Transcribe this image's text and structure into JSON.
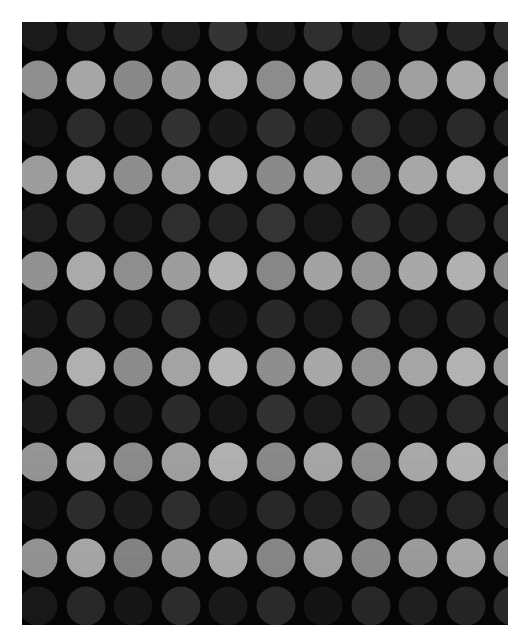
{
  "canvas": {
    "width": 527,
    "height": 643,
    "margin_color": "#ffffff"
  },
  "pattern": {
    "name": "polka-dot-grid",
    "panel": {
      "left": 22,
      "top": 22,
      "width": 486,
      "height": 603,
      "background_color": "#050505"
    },
    "grid": {
      "column_pitch": 47.5,
      "row_pitch": 47.8,
      "first_center_x": 16,
      "first_center_y": 10,
      "dot_diameter": 39,
      "columns": 11,
      "rows": 14,
      "row_offset_mode": "aligned"
    },
    "palette": {
      "light_row_base": "#9a9a9a",
      "dark_row_base": "#1e1e1e",
      "background": "#050505"
    },
    "rows": [
      {
        "index": 0,
        "type": "dark",
        "colors": [
          "#1a1a1a",
          "#232323",
          "#2c2c2c",
          "#1c1c1c",
          "#333333",
          "#1d1d1d",
          "#2e2e2e",
          "#1b1b1b",
          "#303030",
          "#242424",
          "#2a2a2a"
        ]
      },
      {
        "index": 1,
        "type": "light",
        "colors": [
          "#8f8f8f",
          "#a6a6a6",
          "#888888",
          "#9b9b9b",
          "#b0b0b0",
          "#8c8c8c",
          "#a9a9a9",
          "#8b8b8b",
          "#9f9f9f",
          "#ababab",
          "#929292"
        ]
      },
      {
        "index": 2,
        "type": "dark",
        "colors": [
          "#141414",
          "#2b2b2b",
          "#1b1b1b",
          "#313131",
          "#171717",
          "#2f2f2f",
          "#151515",
          "#2d2d2d",
          "#1a1a1a",
          "#292929",
          "#212121"
        ]
      },
      {
        "index": 3,
        "type": "light",
        "colors": [
          "#9c9c9c",
          "#aeaeae",
          "#8d8d8d",
          "#a1a1a1",
          "#b2b2b2",
          "#8a8a8a",
          "#a4a4a4",
          "#909090",
          "#a7a7a7",
          "#b4b4b4",
          "#969696"
        ]
      },
      {
        "index": 4,
        "type": "dark",
        "colors": [
          "#1e1e1e",
          "#2a2a2a",
          "#181818",
          "#2e2e2e",
          "#212121",
          "#343434",
          "#161616",
          "#2b2b2b",
          "#1f1f1f",
          "#252525",
          "#2d2d2d"
        ]
      },
      {
        "index": 5,
        "type": "light",
        "colors": [
          "#919191",
          "#aaaaaa",
          "#8e8e8e",
          "#9d9d9d",
          "#b3b3b3",
          "#878787",
          "#a2a2a2",
          "#949494",
          "#a8a8a8",
          "#b1b1b1",
          "#8f8f8f"
        ]
      },
      {
        "index": 6,
        "type": "dark",
        "colors": [
          "#171717",
          "#2c2c2c",
          "#1d1d1d",
          "#303030",
          "#131313",
          "#282828",
          "#1a1a1a",
          "#323232",
          "#1e1e1e",
          "#262626",
          "#222222"
        ]
      },
      {
        "index": 7,
        "type": "light",
        "colors": [
          "#999999",
          "#b0b0b0",
          "#8b8b8b",
          "#a3a3a3",
          "#b5b5b5",
          "#8d8d8d",
          "#a7a7a7",
          "#929292",
          "#a5a5a5",
          "#b2b2b2",
          "#989898"
        ]
      },
      {
        "index": 8,
        "type": "dark",
        "colors": [
          "#1b1b1b",
          "#2e2e2e",
          "#191919",
          "#2a2a2a",
          "#151515",
          "#313131",
          "#181818",
          "#2c2c2c",
          "#202020",
          "#272727",
          "#2b2b2b"
        ]
      },
      {
        "index": 9,
        "type": "light",
        "colors": [
          "#959595",
          "#acacac",
          "#8c8c8c",
          "#a0a0a0",
          "#b1b1b1",
          "#898989",
          "#a6a6a6",
          "#909090",
          "#a9a9a9",
          "#b3b3b3",
          "#939393"
        ]
      },
      {
        "index": 10,
        "type": "dark",
        "colors": [
          "#161616",
          "#2d2d2d",
          "#1c1c1c",
          "#2f2f2f",
          "#141414",
          "#292929",
          "#1d1d1d",
          "#333333",
          "#1f1f1f",
          "#242424",
          "#232323"
        ]
      },
      {
        "index": 11,
        "type": "light",
        "colors": [
          "#9b9b9b",
          "#afafaf",
          "#8a8a8a",
          "#a2a2a2",
          "#b4b4b4",
          "#8e8e8e",
          "#a8a8a8",
          "#919191",
          "#a4a4a4",
          "#b0b0b0",
          "#979797"
        ]
      },
      {
        "index": 12,
        "type": "dark",
        "colors": [
          "#1a1a1a",
          "#2b2b2b",
          "#171717",
          "#303030",
          "#1b1b1b",
          "#2e2e2e",
          "#151515",
          "#2a2a2a",
          "#212121",
          "#282828",
          "#2c2c2c"
        ]
      },
      {
        "index": 13,
        "type": "light",
        "colors": [
          "#949494",
          "#adadad",
          "#8d8d8d",
          "#9f9f9f",
          "#b2b2b2",
          "#888888",
          "#a5a5a5",
          "#8f8f8f",
          "#aaaaaa",
          "#b1b1b1",
          "#969696"
        ]
      }
    ]
  }
}
